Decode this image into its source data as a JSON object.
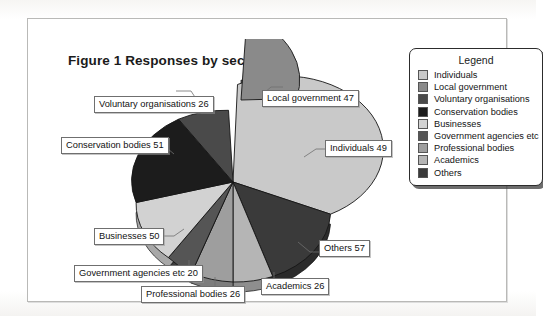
{
  "figure": {
    "title": "Figure 1 Responses by sector"
  },
  "legend": {
    "title": "Legend",
    "entries": [
      {
        "label": "Individuals",
        "color": "#c9c9c9"
      },
      {
        "label": "Local government",
        "color": "#8a8a8a"
      },
      {
        "label": "Voluntary organisations",
        "color": "#4a4a4a"
      },
      {
        "label": "Conservation bodies",
        "color": "#1c1c1c"
      },
      {
        "label": "Businesses",
        "color": "#d2d2d2"
      },
      {
        "label": "Government agencies etc",
        "color": "#555555"
      },
      {
        "label": "Professional bodies",
        "color": "#9e9e9e"
      },
      {
        "label": "Academics",
        "color": "#b5b5b5"
      },
      {
        "label": "Others",
        "color": "#3a3a3a"
      }
    ]
  },
  "callouts": {
    "voluntary": "Voluntary organisations 26",
    "local_government": "Local government 47",
    "conservation": "Conservation bodies 51",
    "individuals": "Individuals 49",
    "businesses": "Businesses 50",
    "others": "Others 57",
    "gov_agencies": "Government agencies etc 20",
    "academics": "Academics 26",
    "professional": "Professional bodies 26"
  },
  "chart_data": {
    "type": "pie",
    "title": "Figure 1 Responses by sector",
    "xlabel": "",
    "ylabel": "",
    "legend_position": "right",
    "grid": false,
    "three_d": true,
    "exploded_slice": "Local government",
    "total": 352,
    "categories": [
      "Individuals",
      "Local government",
      "Voluntary organisations",
      "Conservation bodies",
      "Businesses",
      "Government agencies etc",
      "Professional bodies",
      "Academics",
      "Others"
    ],
    "values": [
      49,
      47,
      26,
      51,
      50,
      20,
      26,
      26,
      57
    ],
    "colors": [
      "#c9c9c9",
      "#8a8a8a",
      "#4a4a4a",
      "#1c1c1c",
      "#d2d2d2",
      "#555555",
      "#9e9e9e",
      "#b5b5b5",
      "#3a3a3a"
    ],
    "slice_order_clockwise_from_top": [
      "Local government",
      "Individuals",
      "Others",
      "Academics",
      "Professional bodies",
      "Government agencies etc",
      "Businesses",
      "Conservation bodies",
      "Voluntary organisations"
    ],
    "data_labels": [
      "Individuals 49",
      "Local government 47",
      "Voluntary organisations 26",
      "Conservation bodies 51",
      "Businesses 50",
      "Government agencies etc 20",
      "Professional bodies 26",
      "Academics 26",
      "Others 57"
    ]
  }
}
